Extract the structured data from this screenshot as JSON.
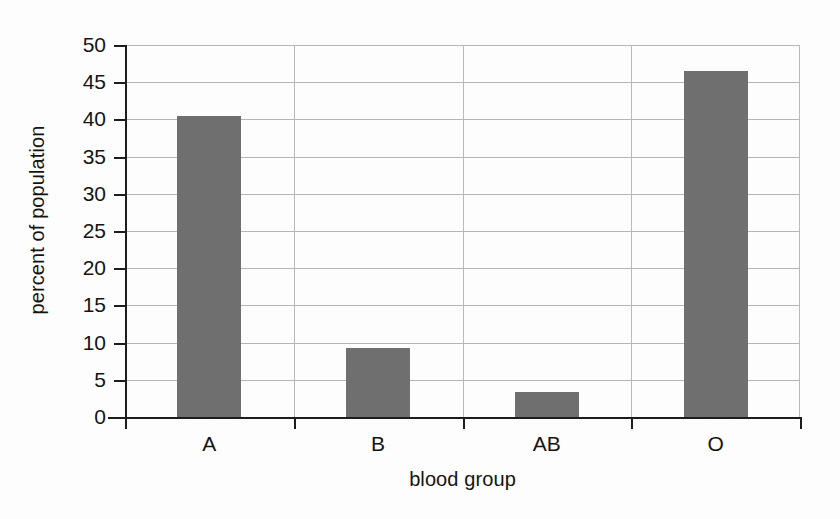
{
  "chart_data": {
    "type": "bar",
    "title": "",
    "subtitle": "",
    "categories": [
      "A",
      "B",
      "AB",
      "O"
    ],
    "values": [
      40.4,
      9.3,
      3.4,
      46.5
    ],
    "xlabel": "blood group",
    "ylabel": "percent of population",
    "ylim": [
      0,
      50
    ],
    "yticks": [
      0,
      5,
      10,
      15,
      20,
      25,
      30,
      35,
      40,
      45,
      50
    ],
    "ytick_labels": [
      "0",
      "5",
      "10",
      "15",
      "20",
      "25",
      "30",
      "35",
      "40",
      "45",
      "50"
    ],
    "grid": "both",
    "legend": "none",
    "bar_color": "#6e6e6e",
    "axis_color": "#1d1d1d",
    "grid_color": "#b5b5b5",
    "background": "#fdfdfd"
  }
}
